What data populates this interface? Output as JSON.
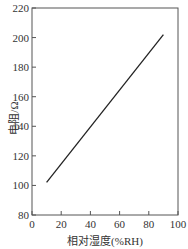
{
  "chart_data": {
    "type": "line",
    "title": "",
    "xlabel": "相对湿度(%RH)",
    "ylabel": "电阻/Ω",
    "xlim": [
      0,
      100
    ],
    "ylim": [
      80,
      220
    ],
    "xticks": [
      "0",
      "20",
      "40",
      "60",
      "80",
      "100"
    ],
    "yticks": [
      "80",
      "100",
      "120",
      "140",
      "160",
      "180",
      "200",
      "220"
    ],
    "grid": false,
    "series": [
      {
        "name": "resistance",
        "x": [
          10,
          90
        ],
        "y": [
          102,
          202
        ]
      }
    ]
  }
}
